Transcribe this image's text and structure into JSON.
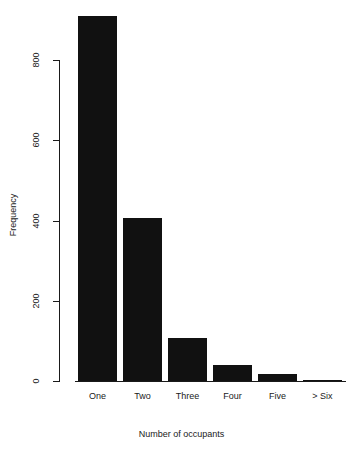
{
  "chart": {
    "background_color": "#ffffff",
    "bar_color": "#111111",
    "axis_color": "#1a1a1a"
  },
  "chart_data": {
    "type": "bar",
    "title": "",
    "xlabel": "Number of occupants",
    "ylabel": "Frequency",
    "categories": [
      "One",
      "Two",
      "Three",
      "Four",
      "Five",
      "> Six"
    ],
    "values": [
      910,
      407,
      107,
      40,
      18,
      3
    ],
    "yticks": [
      0,
      200,
      400,
      600,
      800
    ],
    "ytick_labels": [
      "0",
      "200",
      "400",
      "600",
      "800"
    ],
    "ylim": [
      0,
      910
    ],
    "grid": false,
    "legend": false
  }
}
